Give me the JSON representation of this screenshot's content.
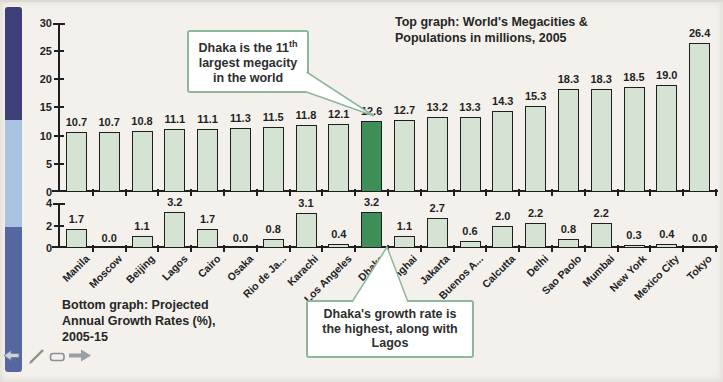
{
  "title": {
    "line1": "Top graph: World's Megacities &",
    "line2": "Populations in millions, 2005"
  },
  "caption": {
    "line1": "Bottom graph: Projected",
    "line2": "Annual Growth Rates (%),",
    "line3": "2005-15"
  },
  "callouts": {
    "top": {
      "pre": "Dhaka is the 11",
      "sup": "th",
      "post": " largest megacity in the world"
    },
    "bottom": {
      "text": "Dhaka's growth rate is the highest, along with Lagos"
    }
  },
  "colors": {
    "background": "#f4f1ec",
    "bar": "#d5e3d3",
    "bar_highlight": "#3d8e57",
    "bar_border": "#1f1f1f",
    "axis": "#1f1f1f",
    "callout_border": "#8fb79b",
    "strip_top": "#3e3e79",
    "strip_middle": "#a9c2e2",
    "strip_bottom": "#56669f"
  },
  "chart_data": [
    {
      "type": "bar",
      "title": "World's Megacities & Populations in millions, 2005",
      "categories": [
        "Manila",
        "Moscow",
        "Beijing",
        "Lagos",
        "Cairo",
        "Osaka",
        "Rio de Ja...",
        "Karachi",
        "Los Angeles",
        "Dhaka",
        "Shanghai",
        "Jakarta",
        "Buenos A...",
        "Calcutta",
        "Delhi",
        "Sao Paolo",
        "Mumbai",
        "New York",
        "Mexico City",
        "Tokyo"
      ],
      "values": [
        10.7,
        10.7,
        10.8,
        11.1,
        11.1,
        11.3,
        11.5,
        11.8,
        12.1,
        12.6,
        12.7,
        13.2,
        13.3,
        14.3,
        15.3,
        18.3,
        18.3,
        18.5,
        19.0,
        26.4
      ],
      "ylim": [
        0,
        30
      ],
      "yticks": [
        0,
        5,
        10,
        15,
        20,
        25,
        30
      ],
      "grid": false,
      "value_labels": true,
      "highlight_category": "Dhaka"
    },
    {
      "type": "bar",
      "title": "Projected Annual Growth Rates (%), 2005-15",
      "categories": [
        "Manila",
        "Moscow",
        "Beijing",
        "Lagos",
        "Cairo",
        "Osaka",
        "Rio de Ja...",
        "Karachi",
        "Los Angeles",
        "Dhaka",
        "Shanghai",
        "Jakarta",
        "Buenos A...",
        "Calcutta",
        "Delhi",
        "Sao Paolo",
        "Mumbai",
        "New York",
        "Mexico City",
        "Tokyo"
      ],
      "values": [
        1.7,
        0.0,
        1.1,
        3.2,
        1.7,
        0.0,
        0.8,
        3.1,
        0.4,
        3.2,
        1.1,
        2.7,
        0.6,
        2.0,
        2.2,
        0.8,
        2.2,
        0.3,
        0.4,
        0.0
      ],
      "ylim": [
        0,
        4
      ],
      "yticks": [
        0,
        2,
        4
      ],
      "grid": false,
      "value_labels": true,
      "highlight_category": "Dhaka"
    }
  ],
  "toolbar": {
    "icons": [
      "previous-page",
      "pen",
      "eraser",
      "next-page"
    ]
  }
}
